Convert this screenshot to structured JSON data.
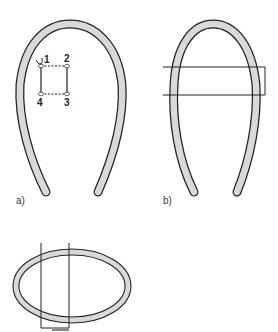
{
  "figure": {
    "panels": [
      {
        "id": "a",
        "label": "a)",
        "description": "Headband with four numbered stitch points forming a square",
        "points": [
          "1",
          "2",
          "3",
          "4"
        ]
      },
      {
        "id": "b",
        "label": "b)",
        "description": "Headband with a horizontal rectangular band across upper sides"
      },
      {
        "id": "c",
        "label": "",
        "description": "Ring/oval loop with a vertical rectangular band"
      }
    ],
    "colors": {
      "band_fill": "#d9d9d9",
      "outline": "#222222",
      "background": "#ffffff"
    }
  }
}
